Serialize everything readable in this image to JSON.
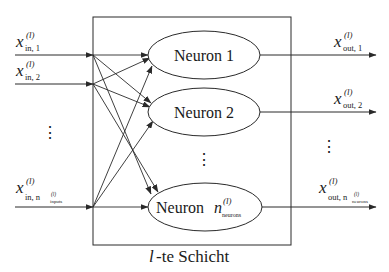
{
  "diagram": {
    "layer_label": "l-te Schicht",
    "layer_label_italic": "l",
    "layer_label_rest": "-te Schicht",
    "stroke_color": "#2a2a2a",
    "background": "#ffffff",
    "inputs": [
      {
        "symbol": "x",
        "sup": "(l)",
        "sub": "in, 1"
      },
      {
        "symbol": "x",
        "sup": "(l)",
        "sub": "in, 2"
      },
      {
        "symbol": "x",
        "sup": "(l)",
        "sub": "in, n",
        "subsub": "inputs",
        "subsup": "(l)"
      }
    ],
    "input_ellipsis": "⋮",
    "neurons": [
      {
        "label": "Neuron 1"
      },
      {
        "label": "Neuron 2"
      },
      {
        "label": "Neuron",
        "var": "n",
        "var_sup": "(l)",
        "var_sub": "neurons"
      }
    ],
    "neuron_ellipsis": "⋮",
    "outputs": [
      {
        "symbol": "x",
        "sup": "(l)",
        "sub": "out, 1"
      },
      {
        "symbol": "x",
        "sup": "(l)",
        "sub": "out, 2"
      },
      {
        "symbol": "x",
        "sup": "(l)",
        "sub": "out, n",
        "subsub": "neurons",
        "subsup": "(l)"
      }
    ],
    "output_ellipsis": "⋮"
  }
}
